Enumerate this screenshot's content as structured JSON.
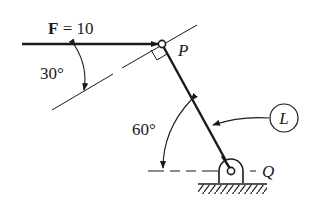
{
  "diagram": {
    "force_label_bold": "F",
    "force_label_rest": " = 10",
    "angle_force": "30°",
    "angle_link": "60°",
    "point_p": "P",
    "point_q": "Q",
    "link_label": "L",
    "colors": {
      "ink": "#1a1a1a",
      "background": "#ffffff"
    }
  }
}
